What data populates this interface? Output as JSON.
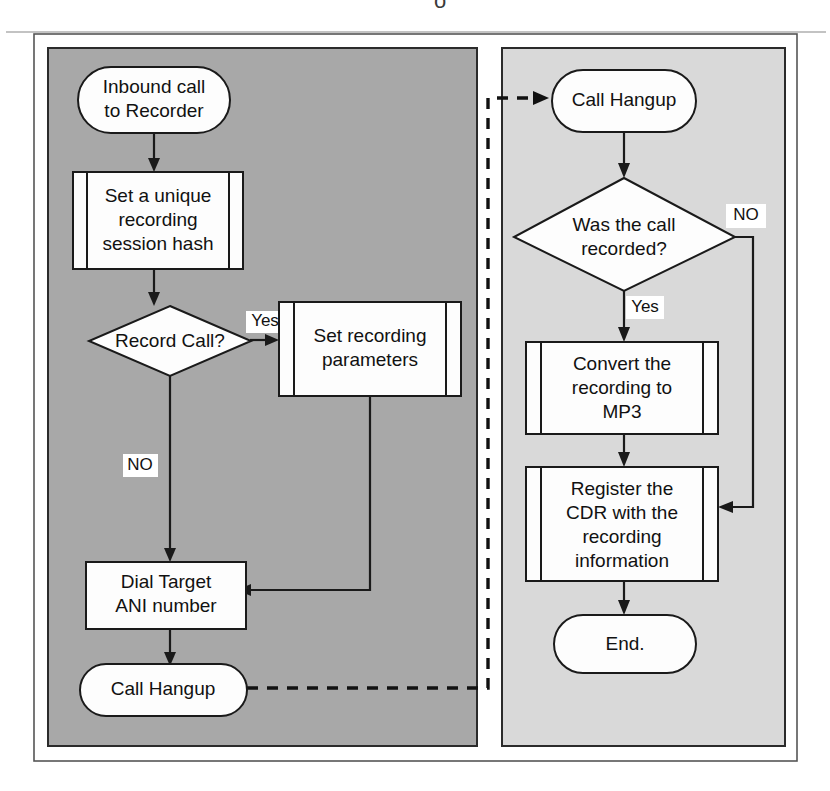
{
  "diagram": {
    "colors": {
      "left_panel_fill": "#a8a8a8",
      "right_panel_fill": "#d9d9d9",
      "outer_frame_fill": "#ffffff",
      "shape_fill": "#fdfdfd",
      "stroke": "#1a1a1a"
    },
    "left_lane": {
      "name": "Inbound call handling lane",
      "nodes": [
        {
          "id": "inbound-call",
          "type": "terminator",
          "lines": [
            "Inbound call",
            "to Recorder"
          ]
        },
        {
          "id": "session-hash",
          "type": "predefined-process",
          "lines": [
            "Set a unique",
            "recording",
            "session hash"
          ]
        },
        {
          "id": "record-call",
          "type": "decision",
          "lines": [
            "Record Call?"
          ]
        },
        {
          "id": "set-rec-params",
          "type": "predefined-process",
          "lines": [
            "Set recording",
            "parameters"
          ]
        },
        {
          "id": "dial-target",
          "type": "process",
          "lines": [
            "Dial Target",
            "ANI number"
          ]
        },
        {
          "id": "call-hangup-left",
          "type": "terminator",
          "lines": [
            "Call Hangup"
          ]
        }
      ],
      "edge_labels": [
        {
          "id": "record-call-yes",
          "text": "Yes"
        },
        {
          "id": "record-call-no",
          "text": "NO"
        }
      ]
    },
    "right_lane": {
      "name": "Post-call processing lane",
      "nodes": [
        {
          "id": "call-hangup-right",
          "type": "terminator",
          "lines": [
            "Call Hangup"
          ]
        },
        {
          "id": "was-call-recorded",
          "type": "decision",
          "lines": [
            "Was the call",
            "recorded?"
          ]
        },
        {
          "id": "convert-mp3",
          "type": "predefined-process",
          "lines": [
            "Convert the",
            "recording to",
            "MP3"
          ]
        },
        {
          "id": "register-cdr",
          "type": "predefined-process",
          "lines": [
            "Register the",
            "CDR with the",
            "recording",
            "information"
          ]
        },
        {
          "id": "end",
          "type": "terminator",
          "lines": [
            "End."
          ]
        }
      ],
      "edge_labels": [
        {
          "id": "was-recorded-yes",
          "text": "Yes"
        },
        {
          "id": "was-recorded-no",
          "text": "NO"
        }
      ]
    },
    "cross_lane_connector": {
      "id": "hangup-to-hangup",
      "style": "dashed",
      "from": "call-hangup-left",
      "to": "call-hangup-right",
      "label": ""
    },
    "cropped_caption_fragment": "o"
  }
}
